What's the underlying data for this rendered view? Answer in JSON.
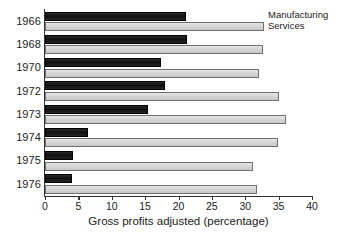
{
  "chart_data": {
    "type": "bar",
    "orientation": "horizontal",
    "title": "",
    "xlabel": "Gross profits adjusted (percentage)",
    "ylabel": "",
    "xlim": [
      0,
      40
    ],
    "xticks": [
      0,
      5,
      10,
      15,
      20,
      25,
      30,
      35,
      40
    ],
    "grid": false,
    "legend_position": "top-right",
    "categories": [
      "1966",
      "1968",
      "1970",
      "1972",
      "1973",
      "1974",
      "1975",
      "1976"
    ],
    "series": [
      {
        "name": "Manufacturing",
        "color": "#141414",
        "values": [
          21.1,
          21.2,
          17.4,
          18.0,
          15.4,
          6.4,
          4.2,
          4.0
        ]
      },
      {
        "name": "Services",
        "color": "#d4d4d4",
        "values": [
          32.8,
          32.7,
          32.1,
          35.1,
          36.1,
          34.9,
          31.2,
          31.8
        ]
      }
    ]
  },
  "axis": {
    "x_label": "Gross profits adjusted (percentage)",
    "tick_labels": [
      "0",
      "5",
      "10",
      "15",
      "20",
      "25",
      "30",
      "35",
      "40"
    ]
  },
  "legend": {
    "entries": [
      {
        "label": "Manufacturing"
      },
      {
        "label": "Services"
      }
    ]
  },
  "colors": {
    "manufacturing": "#141414",
    "services": "#d4d4d4",
    "axis": "#333333",
    "text": "#1c1c1c",
    "background": "#ffffff"
  }
}
